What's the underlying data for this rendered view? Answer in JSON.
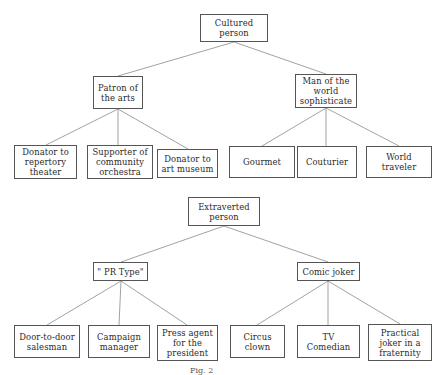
{
  "trees": [
    {
      "root": {
        "label": "Cultured\nperson",
        "box": [
          200,
          14,
          68,
          28
        ]
      },
      "children": [
        {
          "label": "Patron of\nthe arts",
          "box": [
            93,
            76,
            50,
            33
          ],
          "children": [
            {
              "label": "Donator to\nrepertory\ntheater",
              "box": [
                14,
                145,
                63,
                34
              ]
            },
            {
              "label": "Supporter of\ncommunity\norchestra",
              "box": [
                87,
                145,
                66,
                34
              ]
            },
            {
              "label": "Donator to\nart museum",
              "box": [
                157,
                149,
                61,
                29
              ]
            }
          ]
        },
        {
          "label": "Man of the\nworld\nsophisticate",
          "box": [
            295,
            74,
            62,
            34
          ],
          "children": [
            {
              "label": "Gourmet",
              "box": [
                229,
                146,
                66,
                32
              ]
            },
            {
              "label": "Couturier",
              "box": [
                297,
                146,
                60,
                32
              ]
            },
            {
              "label": "World\ntraveler",
              "box": [
                366,
                146,
                66,
                32
              ]
            }
          ]
        }
      ]
    },
    {
      "root": {
        "label": "Extraverted\nperson",
        "box": [
          188,
          197,
          72,
          29
        ]
      },
      "children": [
        {
          "label": "\" PR Type\"",
          "box": [
            93,
            262,
            55,
            19
          ],
          "children": [
            {
              "label": "Door-to-door\nsalesman",
              "box": [
                14,
                325,
                66,
                33
              ]
            },
            {
              "label": "Campaign\nmanager",
              "box": [
                88,
                325,
                62,
                33
              ]
            },
            {
              "label": "Press agent\nfor the\npresident",
              "box": [
                157,
                325,
                61,
                36
              ]
            }
          ]
        },
        {
          "label": "Comic joker",
          "box": [
            297,
            262,
            63,
            19
          ],
          "children": [
            {
              "label": "Circus\nclown",
              "box": [
                230,
                325,
                55,
                33
              ]
            },
            {
              "label": "TV\nComedian",
              "box": [
                297,
                325,
                63,
                33
              ]
            },
            {
              "label": "Practical\njoker in a\nfraternity",
              "box": [
                368,
                324,
                64,
                37
              ]
            }
          ]
        }
      ]
    }
  ],
  "labels": {
    "t0_root": "Cultured\nperson",
    "t0_c0": "Patron of\nthe arts",
    "t0_c0_0": "Donator to\nrepertory\ntheater",
    "t0_c0_1": "Supporter of\ncommunity\norchestra",
    "t0_c0_2": "Donator to\nart museum",
    "t0_c1": "Man of the\nworld\nsophisticate",
    "t0_c1_0": "Gourmet",
    "t0_c1_1": "Couturier",
    "t0_c1_2": "World\ntraveler",
    "t1_root": "Extraverted\nperson",
    "t1_c0": "\" PR Type\"",
    "t1_c0_0": "Door-to-door\nsalesman",
    "t1_c0_1": "Campaign\nmanager",
    "t1_c0_2": "Press agent\nfor the\npresident",
    "t1_c1": "Comic joker",
    "t1_c1_0": "Circus\nclown",
    "t1_c1_1": "TV\nComedian",
    "t1_c1_2": "Practical\njoker in a\nfraternity"
  },
  "caption": "Fig. 2"
}
